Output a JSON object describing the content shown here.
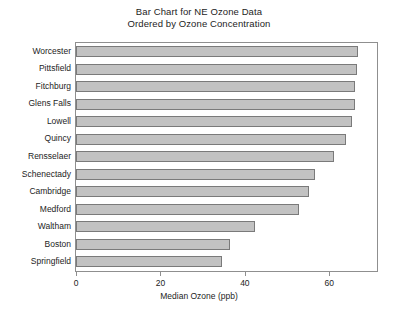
{
  "chart_data": {
    "type": "bar",
    "orientation": "horizontal",
    "title": "Bar Chart for NE Ozone Data",
    "subtitle": "Ordered by Ozone Concentration",
    "title_lines": [
      "Bar Chart for NE Ozone Data",
      "Ordered by Ozone Concentration"
    ],
    "xlabel": "Median Ozone (ppb)",
    "ylabel": "",
    "categories": [
      "Worcester",
      "Pittsfield",
      "Fitchburg",
      "Glens Falls",
      "Lowell",
      "Quincy",
      "Rensselaer",
      "Schenectady",
      "Cambridge",
      "Medford",
      "Waltham",
      "Boston",
      "Springfield"
    ],
    "values": [
      66.8,
      66.5,
      66.2,
      66.1,
      65.4,
      64.0,
      61.2,
      56.7,
      55.1,
      52.9,
      42.4,
      36.5,
      34.6
    ],
    "xlim": [
      0,
      71.3
    ],
    "xticks": [
      0,
      20,
      40,
      60
    ],
    "xtick_labels": [
      "0",
      "20",
      "40",
      "60"
    ],
    "grid": false,
    "legend": null,
    "bar_fill_color": "#c2c2c2",
    "bar_edge_color": "#7a7a7a",
    "frame_color": "#8f8f8f",
    "text_color": "#1d1d1d"
  }
}
